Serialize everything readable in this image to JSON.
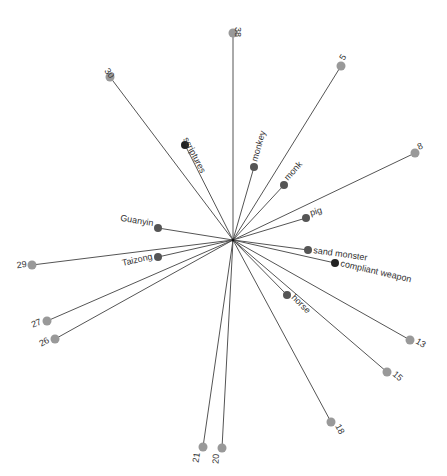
{
  "graph": {
    "type": "star-network",
    "center": {
      "x": 233,
      "y": 240
    },
    "colors": {
      "edge": "#555555",
      "outer_node": "#999999",
      "inner_node": "#555555",
      "key_node": "#222222",
      "label": "#333333"
    },
    "nodes": [
      {
        "id": "38",
        "label": "38",
        "x": 233,
        "y": 33,
        "kind": "outer",
        "label_dx": 2,
        "label_dy": -6,
        "rotate": 90
      },
      {
        "id": "30",
        "label": "30",
        "x": 110,
        "y": 77,
        "kind": "outer",
        "label_dx": -6,
        "label_dy": -6,
        "rotate": 53
      },
      {
        "id": "5",
        "label": "5",
        "x": 341,
        "y": 66,
        "kind": "outer",
        "label_dx": 3,
        "label_dy": -5,
        "rotate": -58
      },
      {
        "id": "8",
        "label": "8",
        "x": 415,
        "y": 153,
        "kind": "outer",
        "label_dx": 4,
        "label_dy": -3,
        "rotate": -25
      },
      {
        "id": "scriptures",
        "label": "scriptures",
        "x": 185,
        "y": 145,
        "kind": "key",
        "label_dx": -2,
        "label_dy": -6,
        "rotate": 63
      },
      {
        "id": "monkey",
        "label": "monkey",
        "x": 254,
        "y": 167,
        "kind": "inner",
        "label_dx": 3,
        "label_dy": -5,
        "rotate": -74
      },
      {
        "id": "monk",
        "label": "monk",
        "x": 284,
        "y": 185,
        "kind": "inner",
        "label_dx": 4,
        "label_dy": -4,
        "rotate": -48
      },
      {
        "id": "pig",
        "label": "pig",
        "x": 306,
        "y": 218,
        "kind": "inner",
        "label_dx": 5,
        "label_dy": -2,
        "rotate": -17
      },
      {
        "id": "Guanyin",
        "label": "Guanyin",
        "x": 158,
        "y": 228,
        "kind": "inner",
        "label_dx": -5,
        "label_dy": -2,
        "rotate": 9,
        "anchor": "end"
      },
      {
        "id": "Taizong",
        "label": "Taizong",
        "x": 158,
        "y": 257,
        "kind": "inner",
        "label_dx": -5,
        "label_dy": 2,
        "rotate": -13,
        "anchor": "end"
      },
      {
        "id": "sand monster",
        "label": "sand monster",
        "x": 308,
        "y": 250,
        "kind": "inner",
        "label_dx": 5,
        "label_dy": 3,
        "rotate": 8
      },
      {
        "id": "compliant weapon",
        "label": "compliant weapon",
        "x": 335,
        "y": 263,
        "kind": "key",
        "label_dx": 5,
        "label_dy": 3,
        "rotate": 13
      },
      {
        "id": "horse",
        "label": "horse",
        "x": 287,
        "y": 295,
        "kind": "inner",
        "label_dx": 4,
        "label_dy": 3,
        "rotate": 45
      },
      {
        "id": "29",
        "label": "29",
        "x": 32,
        "y": 265,
        "kind": "outer",
        "label_dx": -5,
        "label_dy": 2,
        "rotate": -7,
        "anchor": "end"
      },
      {
        "id": "27",
        "label": "27",
        "x": 47,
        "y": 321,
        "kind": "outer",
        "label_dx": -5,
        "label_dy": 3,
        "rotate": -22,
        "anchor": "end"
      },
      {
        "id": "26",
        "label": "26",
        "x": 55,
        "y": 339,
        "kind": "outer",
        "label_dx": -5,
        "label_dy": 3,
        "rotate": -29,
        "anchor": "end"
      },
      {
        "id": "13",
        "label": "13",
        "x": 410,
        "y": 340,
        "kind": "outer",
        "label_dx": 5,
        "label_dy": 3,
        "rotate": 30
      },
      {
        "id": "15",
        "label": "15",
        "x": 387,
        "y": 372,
        "kind": "outer",
        "label_dx": 5,
        "label_dy": 3,
        "rotate": 41
      },
      {
        "id": "18",
        "label": "18",
        "x": 331,
        "y": 422,
        "kind": "outer",
        "label_dx": 4,
        "label_dy": 4,
        "rotate": 62
      },
      {
        "id": "21",
        "label": "21",
        "x": 203,
        "y": 447,
        "kind": "outer",
        "label_dx": -3,
        "label_dy": 6,
        "rotate": -82,
        "anchor": "end"
      },
      {
        "id": "20",
        "label": "20",
        "x": 222,
        "y": 448,
        "kind": "outer",
        "label_dx": -3,
        "label_dy": 6,
        "rotate": -87,
        "anchor": "end"
      }
    ]
  }
}
